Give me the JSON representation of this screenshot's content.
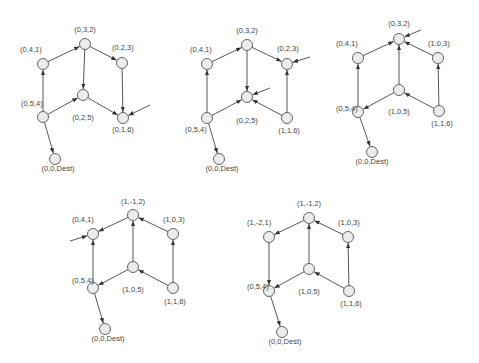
{
  "diagrams": [
    {
      "id": "d1",
      "nodes": [
        {
          "id": "n032",
          "label": "(0,3,2)"
        },
        {
          "id": "n041",
          "label": "(0,4,1)"
        },
        {
          "id": "n023",
          "label": "(0,2,3)"
        },
        {
          "id": "n025",
          "label": "(0,2,5)"
        },
        {
          "id": "n054",
          "label": "(0,5,4)"
        },
        {
          "id": "n016",
          "label": "(0,1,6)"
        },
        {
          "id": "ndest",
          "label": "(0,0,Dest)"
        }
      ],
      "edges": [
        {
          "from": "n041",
          "to": "n032"
        },
        {
          "from": "n032",
          "to": "n023"
        },
        {
          "from": "n032",
          "to": "n025"
        },
        {
          "from": "n054",
          "to": "n041"
        },
        {
          "from": "n054",
          "to": "n025"
        },
        {
          "from": "n025",
          "to": "n016"
        },
        {
          "from": "n023",
          "to": "n016"
        },
        {
          "from": "n054",
          "to": "ndest"
        }
      ],
      "external_arrows": [
        "n016"
      ]
    },
    {
      "id": "d2",
      "nodes": [
        {
          "id": "n032",
          "label": "(0,3,2)"
        },
        {
          "id": "n041",
          "label": "(0,4,1)"
        },
        {
          "id": "n023",
          "label": "(0,2,3)"
        },
        {
          "id": "n025",
          "label": "(0,2,5)"
        },
        {
          "id": "n054",
          "label": "(0,5,4)"
        },
        {
          "id": "n116",
          "label": "(1,1,6)"
        },
        {
          "id": "ndest",
          "label": "(0,0,Dest)"
        }
      ],
      "edges": [
        {
          "from": "n041",
          "to": "n032"
        },
        {
          "from": "n032",
          "to": "n023"
        },
        {
          "from": "n032",
          "to": "n025"
        },
        {
          "from": "n054",
          "to": "n041"
        },
        {
          "from": "n054",
          "to": "n025"
        },
        {
          "from": "n116",
          "to": "n025"
        },
        {
          "from": "n116",
          "to": "n023"
        },
        {
          "from": "n054",
          "to": "ndest"
        }
      ],
      "external_arrows": [
        "n023",
        "n025"
      ]
    },
    {
      "id": "d3",
      "nodes": [
        {
          "id": "n032",
          "label": "(0,3,2)"
        },
        {
          "id": "n041",
          "label": "(0,4,1)"
        },
        {
          "id": "n103",
          "label": "(1,0,3)"
        },
        {
          "id": "n105",
          "label": "(1,0,5)"
        },
        {
          "id": "n054",
          "label": "(0,5,4)"
        },
        {
          "id": "n116",
          "label": "(1,1,6)"
        },
        {
          "id": "ndest",
          "label": "(0,0,Dest)"
        }
      ],
      "edges": [
        {
          "from": "n041",
          "to": "n032"
        },
        {
          "from": "n103",
          "to": "n032"
        },
        {
          "from": "n105",
          "to": "n032"
        },
        {
          "from": "n054",
          "to": "n041"
        },
        {
          "from": "n105",
          "to": "n054"
        },
        {
          "from": "n116",
          "to": "n105"
        },
        {
          "from": "n116",
          "to": "n103"
        },
        {
          "from": "n054",
          "to": "ndest"
        }
      ],
      "external_arrows": [
        "n032"
      ]
    },
    {
      "id": "d4",
      "nodes": [
        {
          "id": "n1m12",
          "label": "(1,-1,2)"
        },
        {
          "id": "n041",
          "label": "(0,4,1)"
        },
        {
          "id": "n103",
          "label": "(1,0,3)"
        },
        {
          "id": "n105",
          "label": "(1,0,5)"
        },
        {
          "id": "n054",
          "label": "(0,5,4)"
        },
        {
          "id": "n116",
          "label": "(1,1,6)"
        },
        {
          "id": "ndest",
          "label": "(0,0,Dest)"
        }
      ],
      "edges": [
        {
          "from": "n1m12",
          "to": "n041"
        },
        {
          "from": "n103",
          "to": "n1m12"
        },
        {
          "from": "n105",
          "to": "n1m12"
        },
        {
          "from": "n054",
          "to": "n041"
        },
        {
          "from": "n105",
          "to": "n054"
        },
        {
          "from": "n116",
          "to": "n105"
        },
        {
          "from": "n116",
          "to": "n103"
        },
        {
          "from": "n054",
          "to": "ndest"
        }
      ],
      "external_arrows": [
        "n041"
      ]
    },
    {
      "id": "d5",
      "nodes": [
        {
          "id": "n1m12",
          "label": "(1,-1,2)"
        },
        {
          "id": "n1m21",
          "label": "(1,-2,1)"
        },
        {
          "id": "n103",
          "label": "(1,0,3)"
        },
        {
          "id": "n105",
          "label": "(1,0,5)"
        },
        {
          "id": "n054",
          "label": "(0,5,4)"
        },
        {
          "id": "n116",
          "label": "(1,1,6)"
        },
        {
          "id": "ndest",
          "label": "(0,0,Dest)"
        }
      ],
      "edges": [
        {
          "from": "n1m12",
          "to": "n1m21"
        },
        {
          "from": "n103",
          "to": "n1m12"
        },
        {
          "from": "n105",
          "to": "n1m12"
        },
        {
          "from": "n1m21",
          "to": "n054"
        },
        {
          "from": "n105",
          "to": "n054"
        },
        {
          "from": "n116",
          "to": "n105"
        },
        {
          "from": "n116",
          "to": "n103"
        },
        {
          "from": "n054",
          "to": "ndest"
        }
      ],
      "external_arrows": []
    }
  ]
}
